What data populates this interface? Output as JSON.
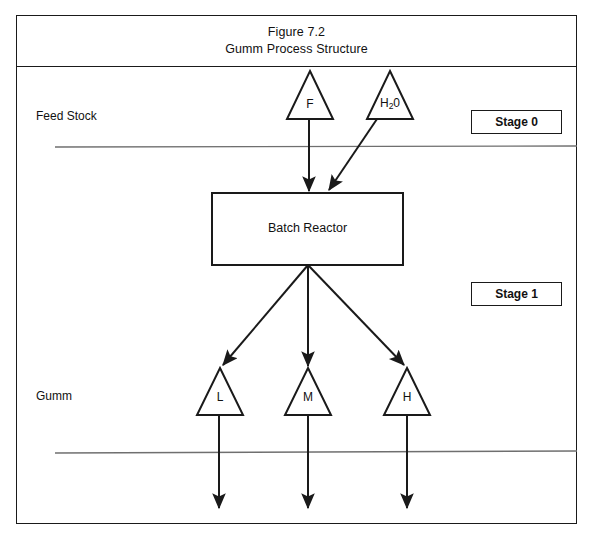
{
  "figure": {
    "title_line_1": "Figure 7.2",
    "title_line_2": "Gumm Process Structure"
  },
  "labels": {
    "feed_stock": "Feed Stock",
    "gumm": "Gumm"
  },
  "stages": [
    {
      "id": "stage-0",
      "label": "Stage 0"
    },
    {
      "id": "stage-1",
      "label": "Stage 1"
    }
  ],
  "process_unit": {
    "label": "Batch Reactor"
  },
  "feed_nodes": [
    {
      "id": "feed-f",
      "label": "F",
      "label_html": "F"
    },
    {
      "id": "feed-h2o",
      "label": "H20",
      "label_html": "H<sub>2</sub>0"
    }
  ],
  "product_nodes": [
    {
      "id": "product-l",
      "label": "L"
    },
    {
      "id": "product-m",
      "label": "M"
    },
    {
      "id": "product-h",
      "label": "H"
    }
  ],
  "colors": {
    "line": "#1a1a1a",
    "divider": "#6f6f6f",
    "background": "#ffffff",
    "text": "#111111"
  }
}
